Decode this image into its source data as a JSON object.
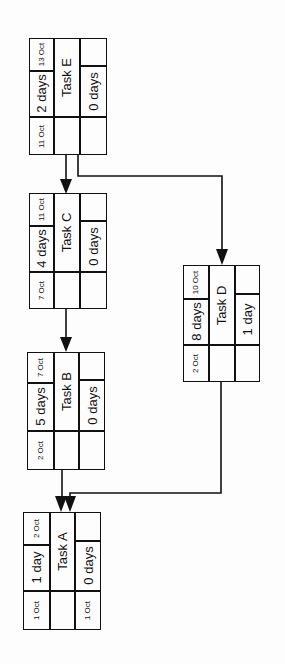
{
  "diagram": {
    "type": "network-diagram",
    "orientation": "rotated-90-ccw",
    "tasks": [
      {
        "id": "E",
        "name": "Task E",
        "duration": "2 days",
        "start": "11 Oct",
        "finish": "13 Oct",
        "float": "0 days",
        "late_start": ""
      },
      {
        "id": "C",
        "name": "Task C",
        "duration": "4 days",
        "start": "7 Oct",
        "finish": "11 Oct",
        "float": "0 days",
        "late_start": ""
      },
      {
        "id": "B",
        "name": "Task B",
        "duration": "5 days",
        "start": "2 Oct",
        "finish": "7 Oct",
        "float": "0 days",
        "late_start": ""
      },
      {
        "id": "A",
        "name": "Task A",
        "duration": "1 day",
        "start": "1 Oct",
        "finish": "2 Oct",
        "float": "0 days",
        "late_start": "1 Oct"
      },
      {
        "id": "D",
        "name": "Task D",
        "duration": "8 days",
        "start": "2 Oct",
        "finish": "10 Oct",
        "float": "1 day",
        "late_start": ""
      }
    ],
    "dependencies": [
      {
        "from": "E",
        "to": "C"
      },
      {
        "from": "E",
        "to": "D"
      },
      {
        "from": "C",
        "to": "B"
      },
      {
        "from": "B",
        "to": "A"
      },
      {
        "from": "D",
        "to": "A"
      }
    ],
    "colors": {
      "line": "#111111",
      "background": "#fdfdfd"
    }
  }
}
